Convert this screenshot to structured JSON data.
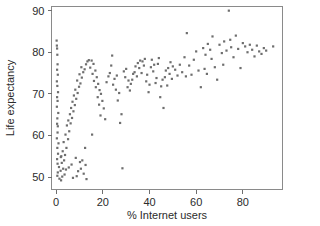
{
  "chart_data": {
    "type": "scatter",
    "title": "",
    "xlabel": "% Internet users",
    "ylabel": "Life expectancy",
    "xlim": [
      -2,
      97
    ],
    "ylim": [
      47,
      91
    ],
    "xticks": [
      0,
      20,
      40,
      60,
      80
    ],
    "yticks": [
      50,
      60,
      70,
      80,
      90
    ],
    "xticklabels": [
      "0",
      "20",
      "40",
      "60",
      "80"
    ],
    "yticklabels": [
      "50",
      "60",
      "70",
      "80",
      "90"
    ],
    "grid": false,
    "legend": "none",
    "marker": "square",
    "marker_color": "#6e6e6e",
    "marker_size": 2.2,
    "frame_color": "#8a8a8a",
    "background_color": "#ffffff",
    "n_points": 196,
    "points": [
      [
        0.2,
        82.8
      ],
      [
        0.3,
        81.6
      ],
      [
        0.4,
        80.9
      ],
      [
        0.5,
        79.4
      ],
      [
        0.6,
        77.1
      ],
      [
        0.4,
        75.8
      ],
      [
        0.7,
        74.6
      ],
      [
        0.3,
        73.0
      ],
      [
        0.5,
        71.9
      ],
      [
        0.8,
        70.4
      ],
      [
        0.4,
        69.2
      ],
      [
        0.6,
        68.3
      ],
      [
        0.3,
        66.9
      ],
      [
        0.9,
        65.4
      ],
      [
        0.5,
        64.1
      ],
      [
        0.4,
        62.8
      ],
      [
        0.7,
        62.2
      ],
      [
        0.6,
        60.7
      ],
      [
        0.3,
        59.3
      ],
      [
        1.0,
        58.1
      ],
      [
        0.5,
        57.0
      ],
      [
        0.8,
        55.6
      ],
      [
        0.4,
        54.3
      ],
      [
        0.6,
        53.2
      ],
      [
        1.2,
        52.4
      ],
      [
        0.7,
        51.1
      ],
      [
        0.5,
        50.3
      ],
      [
        1.4,
        49.6
      ],
      [
        2.1,
        49.2
      ],
      [
        2.6,
        50.1
      ],
      [
        1.9,
        51.5
      ],
      [
        3.0,
        52.0
      ],
      [
        2.4,
        53.4
      ],
      [
        3.4,
        54.0
      ],
      [
        2.0,
        54.8
      ],
      [
        3.8,
        55.3
      ],
      [
        2.8,
        56.2
      ],
      [
        4.4,
        57.0
      ],
      [
        3.2,
        58.4
      ],
      [
        5.1,
        59.1
      ],
      [
        4.0,
        60.2
      ],
      [
        5.6,
        61.0
      ],
      [
        4.6,
        62.4
      ],
      [
        6.2,
        62.9
      ],
      [
        5.2,
        63.6
      ],
      [
        6.8,
        64.2
      ],
      [
        5.9,
        65.1
      ],
      [
        7.4,
        65.8
      ],
      [
        6.4,
        66.6
      ],
      [
        8.0,
        67.3
      ],
      [
        7.0,
        68.1
      ],
      [
        8.6,
        68.8
      ],
      [
        7.6,
        69.6
      ],
      [
        9.2,
        70.2
      ],
      [
        8.2,
        71.0
      ],
      [
        9.8,
        71.7
      ],
      [
        10.4,
        72.5
      ],
      [
        9.0,
        73.2
      ],
      [
        11.0,
        73.9
      ],
      [
        10.0,
        74.7
      ],
      [
        11.6,
        75.2
      ],
      [
        12.2,
        75.9
      ],
      [
        10.8,
        76.4
      ],
      [
        12.8,
        77.1
      ],
      [
        13.4,
        77.8
      ],
      [
        14.0,
        78.1
      ],
      [
        15.2,
        78.0
      ],
      [
        16.0,
        77.2
      ],
      [
        14.6,
        76.3
      ],
      [
        16.8,
        75.6
      ],
      [
        15.6,
        74.8
      ],
      [
        17.4,
        74.0
      ],
      [
        16.2,
        73.1
      ],
      [
        18.0,
        72.4
      ],
      [
        17.0,
        71.6
      ],
      [
        18.6,
        70.9
      ],
      [
        19.2,
        70.0
      ],
      [
        17.8,
        69.2
      ],
      [
        19.8,
        68.3
      ],
      [
        18.4,
        67.4
      ],
      [
        20.4,
        66.5
      ],
      [
        19.0,
        64.8
      ],
      [
        21.0,
        63.9
      ],
      [
        15.4,
        60.2
      ],
      [
        12.4,
        57.0
      ],
      [
        11.2,
        54.0
      ],
      [
        12.6,
        52.9
      ],
      [
        10.6,
        52.0
      ],
      [
        9.4,
        51.4
      ],
      [
        11.8,
        50.8
      ],
      [
        8.8,
        50.2
      ],
      [
        13.0,
        49.5
      ],
      [
        7.2,
        49.8
      ],
      [
        10.2,
        53.6
      ],
      [
        8.4,
        54.6
      ],
      [
        6.6,
        53.0
      ],
      [
        5.4,
        52.3
      ],
      [
        4.2,
        51.8
      ],
      [
        3.6,
        50.6
      ],
      [
        2.2,
        55.0
      ],
      [
        21.6,
        72.8
      ],
      [
        22.4,
        74.2
      ],
      [
        23.0,
        75.0
      ],
      [
        24.0,
        79.2
      ],
      [
        23.6,
        76.8
      ],
      [
        25.0,
        73.6
      ],
      [
        24.4,
        72.2
      ],
      [
        26.0,
        74.4
      ],
      [
        25.6,
        71.0
      ],
      [
        27.0,
        70.2
      ],
      [
        26.4,
        68.4
      ],
      [
        28.0,
        65.1
      ],
      [
        27.4,
        63.0
      ],
      [
        28.4,
        52.1
      ],
      [
        29.0,
        75.4
      ],
      [
        30.0,
        76.0
      ],
      [
        29.6,
        74.0
      ],
      [
        31.0,
        73.2
      ],
      [
        30.6,
        71.6
      ],
      [
        32.0,
        72.4
      ],
      [
        31.6,
        70.8
      ],
      [
        33.0,
        74.8
      ],
      [
        32.6,
        73.4
      ],
      [
        34.0,
        76.6
      ],
      [
        33.6,
        75.2
      ],
      [
        35.0,
        77.4
      ],
      [
        34.6,
        74.2
      ],
      [
        36.0,
        78.0
      ],
      [
        35.6,
        76.2
      ],
      [
        37.0,
        77.8
      ],
      [
        36.6,
        75.0
      ],
      [
        38.0,
        78.4
      ],
      [
        37.6,
        76.8
      ],
      [
        39.0,
        74.6
      ],
      [
        38.6,
        73.0
      ],
      [
        40.0,
        72.2
      ],
      [
        39.6,
        70.4
      ],
      [
        41.0,
        78.2
      ],
      [
        40.6,
        76.4
      ],
      [
        42.0,
        77.0
      ],
      [
        41.6,
        75.4
      ],
      [
        43.0,
        73.8
      ],
      [
        42.6,
        72.6
      ],
      [
        44.0,
        78.6
      ],
      [
        43.6,
        77.2
      ],
      [
        45.0,
        71.8
      ],
      [
        44.6,
        69.2
      ],
      [
        46.0,
        66.6
      ],
      [
        45.6,
        73.4
      ],
      [
        47.0,
        75.6
      ],
      [
        46.6,
        74.0
      ],
      [
        48.0,
        76.2
      ],
      [
        47.6,
        72.0
      ],
      [
        49.0,
        77.6
      ],
      [
        48.6,
        74.8
      ],
      [
        50.0,
        76.6
      ],
      [
        49.6,
        73.6
      ],
      [
        51.0,
        75.8
      ],
      [
        52.0,
        74.4
      ],
      [
        53.0,
        77.0
      ],
      [
        54.0,
        75.2
      ],
      [
        55.0,
        78.8
      ],
      [
        56.0,
        84.6
      ],
      [
        57.0,
        76.8
      ],
      [
        58.0,
        74.6
      ],
      [
        59.0,
        78.2
      ],
      [
        60.0,
        80.2
      ],
      [
        61.0,
        75.6
      ],
      [
        62.0,
        71.6
      ],
      [
        63.0,
        81.0
      ],
      [
        64.0,
        79.4
      ],
      [
        63.6,
        76.0
      ],
      [
        65.0,
        82.0
      ],
      [
        64.6,
        74.8
      ],
      [
        66.0,
        80.6
      ],
      [
        67.0,
        83.8
      ],
      [
        66.6,
        78.4
      ],
      [
        68.0,
        76.4
      ],
      [
        69.0,
        73.4
      ],
      [
        70.0,
        81.8
      ],
      [
        71.0,
        79.8
      ],
      [
        72.0,
        82.6
      ],
      [
        71.6,
        77.0
      ],
      [
        73.0,
        80.4
      ],
      [
        74.0,
        90.0
      ],
      [
        74.6,
        83.0
      ],
      [
        75.0,
        81.2
      ],
      [
        76.0,
        78.8
      ],
      [
        77.0,
        84.0
      ],
      [
        78.0,
        80.8
      ],
      [
        79.0,
        76.2
      ],
      [
        80.0,
        82.2
      ],
      [
        81.0,
        81.4
      ],
      [
        82.0,
        80.0
      ],
      [
        83.0,
        81.8
      ],
      [
        84.0,
        80.6
      ],
      [
        85.0,
        79.0
      ],
      [
        86.0,
        81.6
      ],
      [
        87.0,
        80.2
      ],
      [
        88.0,
        79.6
      ],
      [
        89.0,
        81.0
      ],
      [
        90.0,
        80.4
      ],
      [
        93.0,
        81.4
      ],
      [
        55.6,
        74.2
      ]
    ]
  }
}
